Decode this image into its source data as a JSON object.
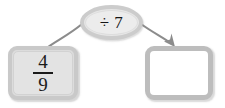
{
  "diagram": {
    "background_color": "#ffffff",
    "input": {
      "label": "4/9",
      "numerator": "4",
      "denominator": "9",
      "fill_color": "#e3e3e3",
      "border_color": "#c9c9c9"
    },
    "operator": {
      "symbol": "÷",
      "operand": "7",
      "label": "÷ 7",
      "fill_color": "#ececec",
      "border_color": "#cccccc"
    },
    "result": {
      "label": "",
      "fill_color": "#ffffff",
      "border_color": "#bdbdbd"
    },
    "connectors": [
      {
        "name": "input-to-operator",
        "has_arrowhead": false,
        "color": "#8c8c8c"
      },
      {
        "name": "operator-to-result",
        "has_arrowhead": true,
        "color": "#8c8c8c"
      }
    ]
  }
}
